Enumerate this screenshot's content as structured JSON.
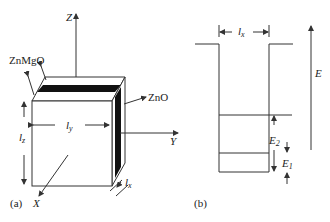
{
  "panel_a": {
    "tag": "(a)",
    "axes": {
      "z": "Z",
      "y": "Y",
      "x": "X"
    },
    "layers": {
      "barrier": "ZnMgO",
      "well": "ZnO"
    },
    "dims": {
      "lz": "l",
      "lz_sub": "z",
      "ly": "l",
      "ly_sub": "y",
      "lx": "l",
      "lx_sub": "x"
    }
  },
  "panel_b": {
    "tag": "(b)",
    "width_label": "l",
    "width_sub": "x",
    "energy_axis": "E",
    "levels": [
      {
        "name": "E",
        "sub": "2"
      },
      {
        "name": "E",
        "sub": "1"
      }
    ]
  },
  "colors": {
    "line": "#333333",
    "layer_dark": "#111111"
  }
}
